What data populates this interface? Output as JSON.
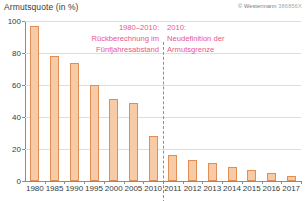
{
  "header": {
    "axis_title": "Armutsquote (in %)",
    "copyright": "© Westermann",
    "copyright_code": "386856X"
  },
  "annotations": {
    "left": "1980–2010:\nRückberechnung im\nFünfjahresabstand",
    "right": "2010:\nNeudefinition der\nArmutsgrenze",
    "divider_year": "2010"
  },
  "colors": {
    "bar_fill": "#f6cba6",
    "bar_border": "#e18d56",
    "annotation": "#e8568e",
    "divider": "#e0649a",
    "grid": "#dedede",
    "axis": "#8c8c8c",
    "text": "#3a3a3a"
  },
  "chart_data": {
    "type": "bar",
    "title": "Armutsquote (in %)",
    "xlabel": "",
    "ylabel": "Armutsquote (in %)",
    "ylim": [
      0,
      100
    ],
    "yticks": [
      0,
      20,
      40,
      60,
      80,
      100
    ],
    "grid": true,
    "legend": "none",
    "categories": [
      "1980",
      "1985",
      "1990",
      "1995",
      "2000",
      "2005",
      "2010",
      "2011",
      "2012",
      "2013",
      "2014",
      "2015",
      "2016",
      "2017"
    ],
    "values": [
      97,
      78,
      74,
      60,
      51,
      49,
      28,
      16,
      13,
      11,
      9,
      7,
      5,
      3
    ],
    "series": [
      {
        "name": "Armutsquote",
        "values": [
          97,
          78,
          74,
          60,
          51,
          49,
          28,
          16,
          13,
          11,
          9,
          7,
          5,
          3
        ]
      }
    ],
    "annotations": [
      {
        "text": "1980–2010: Rückberechnung im Fünfjahresabstand",
        "position": "left-of-divider"
      },
      {
        "text": "2010: Neudefinition der Armutsgrenze",
        "position": "right-of-divider"
      }
    ]
  }
}
